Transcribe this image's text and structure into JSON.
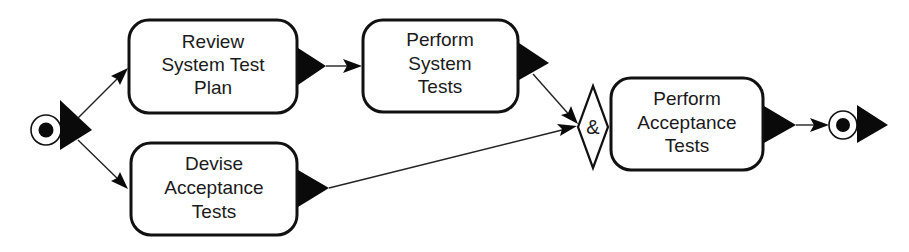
{
  "diagram": {
    "type": "activity-flow",
    "start_node": {
      "label": "start"
    },
    "end_node": {
      "label": "end"
    },
    "activities": [
      {
        "id": "review",
        "lines": [
          "Review",
          "System Test",
          "Plan"
        ]
      },
      {
        "id": "perform_system",
        "lines": [
          "Perform",
          "System",
          "Tests"
        ]
      },
      {
        "id": "devise",
        "lines": [
          "Devise",
          "Acceptance",
          "Tests"
        ]
      },
      {
        "id": "perform_acceptance",
        "lines": [
          "Perform",
          "Acceptance",
          "Tests"
        ]
      }
    ],
    "join": {
      "symbol": "&"
    },
    "edges": [
      {
        "from": "start",
        "to": "review"
      },
      {
        "from": "start",
        "to": "devise"
      },
      {
        "from": "review",
        "to": "perform_system"
      },
      {
        "from": "perform_system",
        "to": "join"
      },
      {
        "from": "devise",
        "to": "join"
      },
      {
        "from": "join",
        "to": "perform_acceptance"
      },
      {
        "from": "perform_acceptance",
        "to": "end"
      }
    ],
    "colors": {
      "stroke": "#111111",
      "fill": "#ffffff",
      "text": "#1a1a1a"
    }
  }
}
